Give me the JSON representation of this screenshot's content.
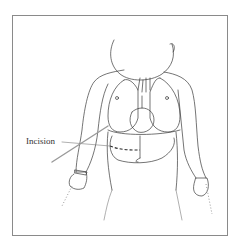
{
  "figure": {
    "labels": {
      "incision": "Incision"
    },
    "colors": {
      "line": "#3a3a3a",
      "frame": "#8a8a8a",
      "tube": "#9a9a9a",
      "background": "#ffffff"
    }
  }
}
